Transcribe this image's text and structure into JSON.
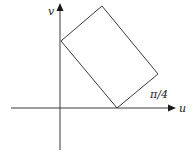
{
  "diagram": {
    "type": "coordinate-transformation-sketch",
    "axes": {
      "horizontal_label": "u",
      "vertical_label": "v"
    },
    "annotation": {
      "angle_label": "π/4"
    },
    "shape": {
      "kind": "rotated-rectangle",
      "vertices": [
        {
          "name": "left",
          "x": 61,
          "y": 41
        },
        {
          "name": "top",
          "x": 102,
          "y": 6
        },
        {
          "name": "right",
          "x": 158,
          "y": 74
        },
        {
          "name": "bottom",
          "x": 117,
          "y": 108
        }
      ]
    },
    "colors": {
      "line": "#3a3a3a",
      "text": "#1a1a1a",
      "background": "#ffffff"
    }
  }
}
